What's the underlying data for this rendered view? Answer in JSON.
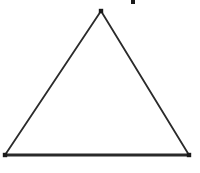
{
  "figure": {
    "title": "triangle-diagram",
    "background_color": "#ffffff",
    "width": 200,
    "height": 173,
    "stroke_color": "#2a2a2a",
    "marker_color": "#1a1a1a",
    "side_stroke_width": 1.8,
    "base_stroke_width": 2.8,
    "marker_size": 4.4
  },
  "chart_data": {
    "type": "diagram",
    "shape": "triangle",
    "title": "",
    "xlabel": "",
    "ylabel": "",
    "grid": false,
    "legend": null,
    "xlim": [
      0,
      200
    ],
    "ylim": [
      0,
      173
    ],
    "vertices": [
      {
        "name": "apex",
        "label": "",
        "x": 101,
        "y": 11
      },
      {
        "name": "bottom-right",
        "label": "",
        "x": 189,
        "y": 155
      },
      {
        "name": "bottom-left",
        "label": "",
        "x": 5,
        "y": 155
      }
    ],
    "edges": [
      {
        "name": "left-side",
        "from": "bottom-left",
        "to": "apex",
        "x1": 5,
        "y1": 155,
        "x2": 101,
        "y2": 11,
        "width": 1.8
      },
      {
        "name": "right-side",
        "from": "apex",
        "to": "bottom-right",
        "x1": 101,
        "y1": 11,
        "x2": 189,
        "y2": 155,
        "width": 1.8
      },
      {
        "name": "base",
        "from": "bottom-left",
        "to": "bottom-right",
        "x1": 5,
        "y1": 155,
        "x2": 189,
        "y2": 155,
        "width": 2.8
      }
    ],
    "stray_marks": [
      {
        "name": "top-right-speck",
        "x": 133,
        "y": 2,
        "width": 4,
        "height": 4
      }
    ]
  }
}
